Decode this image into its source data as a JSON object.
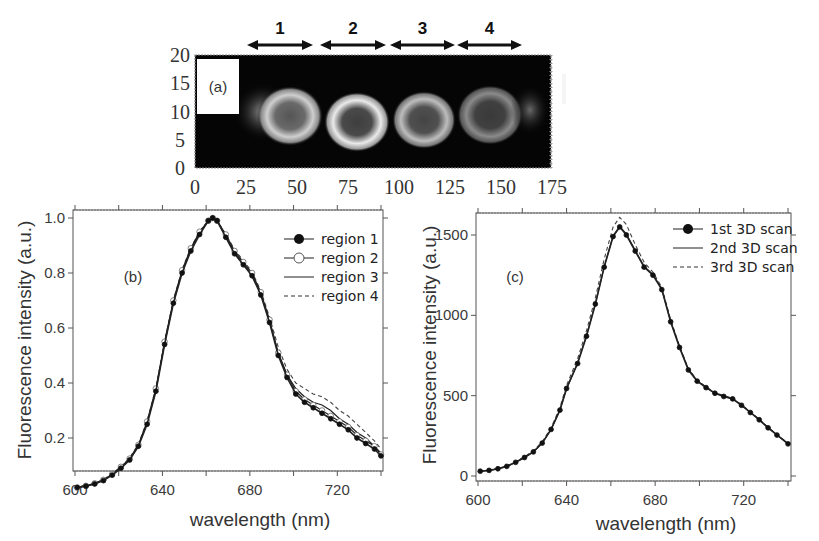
{
  "figure": {
    "panel_a": {
      "label": "(a)",
      "region_labels": [
        "1",
        "2",
        "3",
        "4"
      ],
      "y_ticks": [
        "20",
        "15",
        "10",
        "5",
        "0"
      ],
      "x_ticks": [
        "0",
        "25",
        "50",
        "75",
        "100",
        "125",
        "150",
        "175"
      ]
    },
    "panel_b": {
      "label": "(b)"
    },
    "panel_c": {
      "label": "(c)"
    }
  },
  "chart_data": [
    {
      "id": "panel_a",
      "type": "heatmap",
      "title": "(a)",
      "description": "Grayscale fluorescence image of four ring-shaped regions (cells) along a horizontal line, with region markers 1-4 as double-headed arrows above",
      "xlabel": "",
      "ylabel": "",
      "xlim": [
        0,
        175
      ],
      "ylim": [
        0,
        20
      ],
      "x_ticks": [
        0,
        25,
        50,
        75,
        100,
        125,
        150,
        175
      ],
      "y_ticks": [
        0,
        5,
        10,
        15,
        20
      ],
      "regions": [
        {
          "name": "1",
          "x_range": [
            22,
            55
          ]
        },
        {
          "name": "2",
          "x_range": [
            56,
            89
          ]
        },
        {
          "name": "3",
          "x_range": [
            90,
            122
          ]
        },
        {
          "name": "4",
          "x_range": [
            123,
            156
          ]
        }
      ],
      "annotations": [
        "(a)",
        "white scale bar near x≈162, y≈10-15"
      ]
    },
    {
      "id": "panel_b",
      "type": "line",
      "title": "(b)",
      "xlabel": "wavelength (nm)",
      "ylabel": "Fluorescence intensity (a.u.)",
      "xlim": [
        600,
        740
      ],
      "ylim": [
        0,
        1.03
      ],
      "x_ticks": [
        600,
        640,
        680,
        720
      ],
      "y_ticks": [
        0.2,
        0.4,
        0.6,
        0.8,
        1.0
      ],
      "grid": false,
      "legend_position": "upper right",
      "x": [
        601,
        605,
        609,
        613,
        617,
        621,
        625,
        629,
        633,
        637,
        641,
        645,
        649,
        653,
        657,
        661,
        663,
        665,
        669,
        673,
        677,
        681,
        685,
        689,
        693,
        697,
        701,
        705,
        709,
        713,
        717,
        721,
        725,
        729,
        733,
        737,
        740
      ],
      "series": [
        {
          "name": "region 1",
          "marker": "filled-circle",
          "line": "solid",
          "values": [
            0.02,
            0.025,
            0.033,
            0.045,
            0.065,
            0.09,
            0.12,
            0.17,
            0.25,
            0.37,
            0.54,
            0.69,
            0.8,
            0.88,
            0.94,
            0.99,
            1.0,
            0.99,
            0.93,
            0.87,
            0.83,
            0.79,
            0.72,
            0.62,
            0.5,
            0.42,
            0.36,
            0.33,
            0.31,
            0.29,
            0.27,
            0.25,
            0.23,
            0.2,
            0.18,
            0.16,
            0.135
          ]
        },
        {
          "name": "region 2",
          "marker": "open-circle",
          "line": "solid",
          "values": [
            0.02,
            0.026,
            0.035,
            0.048,
            0.068,
            0.095,
            0.125,
            0.175,
            0.26,
            0.38,
            0.55,
            0.7,
            0.81,
            0.89,
            0.95,
            0.99,
            1.0,
            0.99,
            0.94,
            0.88,
            0.84,
            0.8,
            0.73,
            0.63,
            0.51,
            0.43,
            0.37,
            0.34,
            0.32,
            0.3,
            0.28,
            0.26,
            0.24,
            0.21,
            0.19,
            0.17,
            0.14
          ]
        },
        {
          "name": "region 3",
          "marker": "none",
          "line": "solid",
          "values": [
            0.02,
            0.026,
            0.034,
            0.047,
            0.067,
            0.093,
            0.123,
            0.173,
            0.255,
            0.375,
            0.545,
            0.695,
            0.805,
            0.885,
            0.945,
            0.99,
            1.0,
            0.99,
            0.935,
            0.875,
            0.835,
            0.795,
            0.725,
            0.625,
            0.505,
            0.43,
            0.38,
            0.35,
            0.33,
            0.32,
            0.3,
            0.27,
            0.25,
            0.22,
            0.2,
            0.17,
            0.145
          ]
        },
        {
          "name": "region 4",
          "marker": "none",
          "line": "dashed",
          "values": [
            0.02,
            0.027,
            0.036,
            0.049,
            0.07,
            0.097,
            0.127,
            0.178,
            0.262,
            0.382,
            0.552,
            0.702,
            0.812,
            0.892,
            0.952,
            0.99,
            1.0,
            0.99,
            0.94,
            0.885,
            0.845,
            0.805,
            0.735,
            0.64,
            0.53,
            0.45,
            0.4,
            0.38,
            0.36,
            0.35,
            0.33,
            0.3,
            0.28,
            0.25,
            0.22,
            0.19,
            0.16
          ]
        }
      ]
    },
    {
      "id": "panel_c",
      "type": "line",
      "title": "(c)",
      "xlabel": "wavelength (nm)",
      "ylabel": "Fluorescence intensity (a.u.)",
      "xlim": [
        600,
        740
      ],
      "ylim": [
        -20,
        1640
      ],
      "x_ticks": [
        600,
        640,
        680,
        720
      ],
      "y_ticks": [
        0,
        500,
        1000,
        1500
      ],
      "grid": false,
      "legend_position": "upper right",
      "x": [
        601,
        605,
        609,
        613,
        617,
        621,
        625,
        629,
        633,
        637,
        640,
        645,
        649,
        653,
        657,
        661,
        664,
        667,
        671,
        675,
        679,
        683,
        687,
        691,
        695,
        699,
        703,
        707,
        711,
        715,
        719,
        723,
        727,
        731,
        735,
        740
      ],
      "series": [
        {
          "name": "1st 3D scan",
          "marker": "filled-circle",
          "line": "solid",
          "values": [
            30,
            35,
            45,
            60,
            85,
            115,
            150,
            205,
            290,
            410,
            545,
            700,
            870,
            1070,
            1300,
            1490,
            1550,
            1500,
            1400,
            1300,
            1250,
            1160,
            960,
            800,
            660,
            590,
            550,
            515,
            495,
            480,
            440,
            395,
            350,
            300,
            255,
            200
          ]
        },
        {
          "name": "2nd 3D scan",
          "marker": "none",
          "line": "solid",
          "values": [
            30,
            35,
            45,
            60,
            85,
            115,
            150,
            205,
            290,
            410,
            545,
            705,
            875,
            1075,
            1305,
            1495,
            1555,
            1505,
            1405,
            1305,
            1255,
            1165,
            965,
            805,
            665,
            592,
            552,
            517,
            497,
            482,
            442,
            397,
            352,
            302,
            257,
            202
          ]
        },
        {
          "name": "3rd 3D scan",
          "marker": "none",
          "line": "dashed",
          "values": [
            30,
            36,
            47,
            63,
            88,
            120,
            157,
            213,
            300,
            425,
            565,
            730,
            905,
            1110,
            1350,
            1550,
            1610,
            1565,
            1440,
            1330,
            1270,
            1175,
            975,
            810,
            668,
            595,
            555,
            520,
            500,
            484,
            444,
            399,
            353,
            303,
            258,
            203
          ]
        }
      ]
    }
  ]
}
